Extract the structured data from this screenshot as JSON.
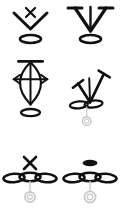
{
  "canvas": {
    "width": 121,
    "height": 214,
    "background_color": "#ffffff",
    "ink_color": "#111111",
    "ghost_color": "#c9c9c9"
  },
  "sheet": {
    "title": "symbol sheet",
    "layout": "2 columns x 3 rows",
    "symbol_count": 6
  },
  "symbols": [
    {
      "id": "symbol-1",
      "position": "row-1-col-1",
      "name": "chevron-with-cross-over-ring",
      "parts": [
        "x-cross-mark",
        "downward-chevron",
        "hollow-ellipse"
      ],
      "ellipse_count": 1,
      "has_ghost_stem": false
    },
    {
      "id": "symbol-2",
      "position": "row-1-col-2",
      "name": "serif-vee-with-stem-over-ring",
      "parts": [
        "serif-capped-vee",
        "center-vertical-stem",
        "hollow-ellipse"
      ],
      "ellipse_count": 1,
      "has_ghost_stem": false
    },
    {
      "id": "symbol-3",
      "position": "row-2-col-1",
      "name": "lens-with-arrow-crossbars-over-ring",
      "parts": [
        "top-horizontal-bar",
        "lens-almond-outline",
        "center-vertical-stem",
        "left-arrowhead",
        "right-arrowhead",
        "hollow-ellipse"
      ],
      "ellipse_count": 1,
      "has_ghost_stem": false
    },
    {
      "id": "symbol-4",
      "position": "row-2-col-2",
      "name": "tilted-serif-vee-over-double-ring",
      "parts": [
        "tilted-serif-capped-vee",
        "center-vertical-stem",
        "hollow-ellipse-pair",
        "ghost-stem",
        "ghost-ring"
      ],
      "ellipse_count": 2,
      "has_ghost_stem": true
    },
    {
      "id": "symbol-5",
      "position": "row-3-col-1",
      "name": "cross-over-triple-ring",
      "parts": [
        "x-cross-mark",
        "hollow-ellipse-triple",
        "ghost-stem",
        "ghost-ring"
      ],
      "ellipse_count": 3,
      "has_ghost_stem": true
    },
    {
      "id": "symbol-6",
      "position": "row-3-col-2",
      "name": "filled-dot-over-triple-ring",
      "parts": [
        "filled-ellipse-dot",
        "hollow-ellipse-triple",
        "ghost-stem",
        "ghost-ring"
      ],
      "ellipse_count": 3,
      "has_ghost_stem": true
    }
  ]
}
